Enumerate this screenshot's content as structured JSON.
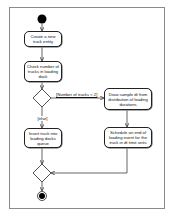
{
  "diagram": {
    "type": "UML activity diagram",
    "start_node": "initial-node",
    "end_node": "final-node",
    "actions": [
      {
        "id": "a1",
        "label": "Create a new truck entity"
      },
      {
        "id": "a2",
        "label": "Check number of trucks in loading dock"
      },
      {
        "id": "a3",
        "label": "Draw sample dt from distribution of loading durations"
      },
      {
        "id": "a4",
        "label": "Insert truck into loading docks queue"
      },
      {
        "id": "a5",
        "label": "Schedule an end of loading event for the truck in dt time units"
      }
    ],
    "guards": {
      "yes": "[Number of trucks < 2]",
      "else": "[else]"
    },
    "edges": [
      {
        "from": "start",
        "to": "a1"
      },
      {
        "from": "a1",
        "to": "a2"
      },
      {
        "from": "a2",
        "to": "decision"
      },
      {
        "from": "decision",
        "to": "a3",
        "guard": "[Number of trucks < 2]"
      },
      {
        "from": "decision",
        "to": "a4",
        "guard": "[else]"
      },
      {
        "from": "a3",
        "to": "a5"
      },
      {
        "from": "a4",
        "to": "merge"
      },
      {
        "from": "a5",
        "to": "merge"
      },
      {
        "from": "merge",
        "to": "end"
      }
    ],
    "colors": {
      "line": "#222222",
      "frame": "#8a8a8a",
      "fill": "#ffffff"
    }
  }
}
